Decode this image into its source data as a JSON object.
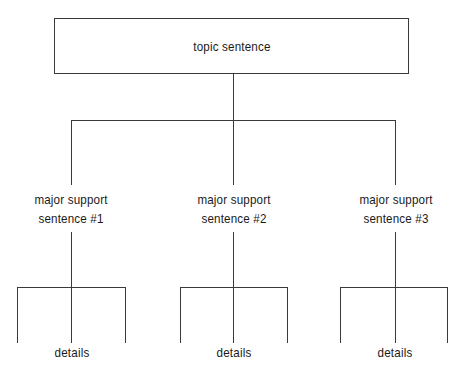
{
  "diagram": {
    "type": "tree",
    "root": {
      "label": "topic sentence"
    },
    "supports": [
      {
        "line1": "major support",
        "line2": "sentence #1",
        "details_label": "details"
      },
      {
        "line1": "major support",
        "line2": "sentence #2",
        "details_label": "details"
      },
      {
        "line1": "major support",
        "line2": "sentence #3",
        "details_label": "details"
      }
    ],
    "colors": {
      "line": "#3a3a3a",
      "text": "#1a1a1a",
      "background": "#ffffff"
    }
  }
}
